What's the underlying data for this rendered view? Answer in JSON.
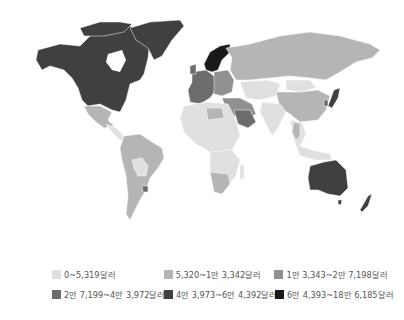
{
  "map": {
    "type": "choropleth-world",
    "metric": "GDP per capita (달러)",
    "background": "#ffffff",
    "border_color": "#ffffff"
  },
  "legend": {
    "items": [
      {
        "label": "0~5,319달러",
        "color": "#e0e0e0"
      },
      {
        "label": "5,320~1만 3,342달러",
        "color": "#b5b5b5"
      },
      {
        "label": "1만 3,343~2만 7,198달러",
        "color": "#909090"
      },
      {
        "label": "2만 7,199~4만 3,972달러",
        "color": "#6c6c6c"
      },
      {
        "label": "4만 3,973~6만 4,392달러",
        "color": "#404040"
      },
      {
        "label": "6만 4,393~18만 6,185달러",
        "color": "#1a1a1a"
      }
    ]
  },
  "regions": [
    {
      "name": "North America",
      "class": 4
    },
    {
      "name": "Greenland",
      "class": 4
    },
    {
      "name": "Mexico",
      "class": 1
    },
    {
      "name": "Central America",
      "class": 0
    },
    {
      "name": "South America",
      "class": 1
    },
    {
      "name": "Bolivia/Paraguay",
      "class": 0
    },
    {
      "name": "Western Europe",
      "class": 3
    },
    {
      "name": "Scandinavia",
      "class": 5
    },
    {
      "name": "Eastern Europe",
      "class": 2
    },
    {
      "name": "Russia",
      "class": 1
    },
    {
      "name": "Central Asia",
      "class": 0
    },
    {
      "name": "Mongolia",
      "class": 0
    },
    {
      "name": "China",
      "class": 1
    },
    {
      "name": "Japan",
      "class": 4
    },
    {
      "name": "South Korea",
      "class": 3
    },
    {
      "name": "Middle East",
      "class": 2
    },
    {
      "name": "Saudi Arabia",
      "class": 3
    },
    {
      "name": "India",
      "class": 0
    },
    {
      "name": "Southeast Asia",
      "class": 0
    },
    {
      "name": "North Africa",
      "class": 0
    },
    {
      "name": "Libya/Algeria",
      "class": 1
    },
    {
      "name": "Sub-Saharan Africa",
      "class": 0
    },
    {
      "name": "Southern Africa",
      "class": 1
    },
    {
      "name": "Australia",
      "class": 4
    },
    {
      "name": "New Zealand",
      "class": 4
    }
  ]
}
